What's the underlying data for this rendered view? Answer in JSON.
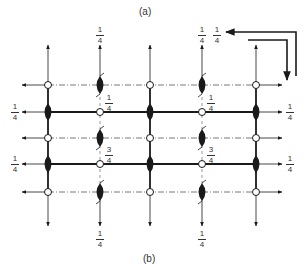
{
  "captions": {
    "top": "(a)",
    "bottom": "(b)"
  },
  "colors": {
    "ink": "#1a1a1a",
    "background": "#ffffff"
  },
  "grid": {
    "columns_x": [
      48,
      100,
      150,
      202,
      256
    ],
    "rows_y": [
      85,
      112,
      138,
      164,
      192
    ],
    "solid_rows": [
      1,
      3
    ],
    "dashdot_rows": [
      0,
      2,
      4
    ],
    "circle_radius": 3.5,
    "ellipse_rx": 3.5,
    "ellipse_ry": 9
  },
  "labels": {
    "top_left_row": {
      "num": "1",
      "den": "4"
    },
    "top_right_row": {
      "num": "1",
      "den": "4"
    },
    "bottom_left_row": {
      "num": "1",
      "den": "4"
    },
    "bottom_right_row": {
      "num": "1",
      "den": "4"
    },
    "col2_top": {
      "num": "1",
      "den": "4"
    },
    "col4_top": {
      "num": "1",
      "den": "4"
    },
    "corner_top": {
      "num": "1",
      "den": "4"
    },
    "col2_bottom": {
      "num": "1",
      "den": "4"
    },
    "col4_bottom": {
      "num": "1",
      "den": "4"
    },
    "inner_row1_col2": {
      "num": "1",
      "den": "4"
    },
    "inner_row1_col4": {
      "num": "1",
      "den": "4"
    },
    "inner_row3_col2": {
      "num": "3",
      "den": "4"
    },
    "inner_row3_col4": {
      "num": "3",
      "den": "4"
    }
  },
  "symbols": {
    "open_circle": "inversion-center",
    "filled_lens": "two-fold-screw-axis",
    "corner_arrows": "axis-direction-indicator"
  }
}
